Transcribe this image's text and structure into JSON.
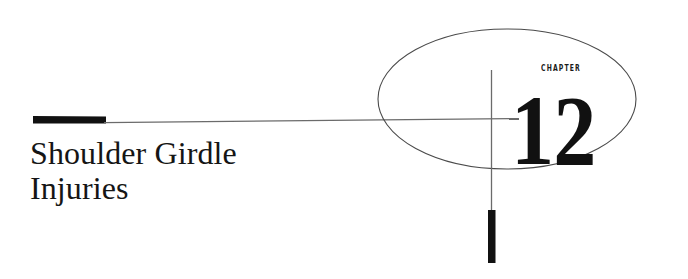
{
  "page": {
    "kind": "book-chapter-opener",
    "background_color": "#ffffff",
    "width": 688,
    "height": 279
  },
  "chapter": {
    "label": "CHAPTER",
    "number": "12",
    "number_color": "#111111",
    "label_color": "#1a1a1a"
  },
  "title": {
    "full": "Shoulder Girdle Injuries",
    "lines": [
      "Shoulder Girdle",
      "Injuries"
    ],
    "color": "#151515"
  },
  "decoration": {
    "ellipse": {
      "name": "outline-ellipse",
      "cx": 507,
      "cy": 99,
      "rx": 129,
      "ry": 70,
      "stroke": "#4a4a4a",
      "stroke_width": 1,
      "fill": "none"
    },
    "vertical_rule": {
      "name": "vertical-crosshair-line",
      "x": 491,
      "y1": 70,
      "y2": 212,
      "stroke": "#6b6b6b",
      "stroke_width": 1.2
    },
    "vertical_bar": {
      "name": "vertical-accent-bar",
      "x": 488,
      "y": 210,
      "width": 7,
      "height": 53,
      "fill": "#111111"
    },
    "horizontal_rule": {
      "name": "horizontal-sloped-line",
      "x1": 104,
      "y1": 123,
      "x2": 519,
      "y2": 119,
      "stroke": "#6b6b6b",
      "stroke_width": 1.2
    },
    "horizontal_bar": {
      "name": "horizontal-accent-bar",
      "x1": 33,
      "y1": 119,
      "x2": 106,
      "y2": 123,
      "fill": "#111111",
      "thickness": 7
    }
  }
}
